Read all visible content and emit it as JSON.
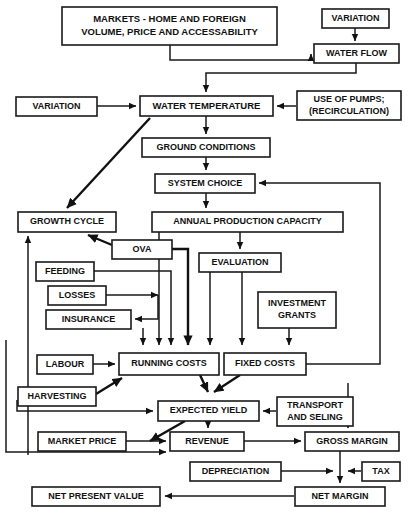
{
  "figure": {
    "type": "flowchart",
    "background": "#ffffff",
    "line_color": "#1a1a1a",
    "box_fill": "#ffffff"
  },
  "nodes": [
    {
      "id": "markets",
      "label": "MARKETS - HOME AND FOREIGN\nVOLUME, PRICE AND ACCESSABILITY",
      "x": 62,
      "y": 7,
      "w": 215,
      "h": 38,
      "fs": 9.5
    },
    {
      "id": "variation1",
      "label": "VARIATION",
      "x": 322,
      "y": 9,
      "w": 67,
      "h": 19,
      "fs": 9
    },
    {
      "id": "waterflow",
      "label": "WATER FLOW",
      "x": 314,
      "y": 44,
      "w": 85,
      "h": 19,
      "fs": 9
    },
    {
      "id": "variation2",
      "label": "VARIATION",
      "x": 16,
      "y": 97,
      "w": 81,
      "h": 19,
      "fs": 9
    },
    {
      "id": "watertemp",
      "label": "WATER TEMPERATURE",
      "x": 140,
      "y": 96,
      "w": 133,
      "h": 20,
      "fs": 9.5
    },
    {
      "id": "pumps",
      "label": "USE OF PUMPS;\n(RECIRCULATION)",
      "x": 297,
      "y": 91,
      "w": 104,
      "h": 29,
      "fs": 9
    },
    {
      "id": "ground",
      "label": "GROUND CONDITIONS",
      "x": 142,
      "y": 138,
      "w": 128,
      "h": 19,
      "fs": 9
    },
    {
      "id": "system",
      "label": "SYSTEM CHOICE",
      "x": 155,
      "y": 174,
      "w": 100,
      "h": 19,
      "fs": 9
    },
    {
      "id": "growth",
      "label": "GROWTH CYCLE",
      "x": 18,
      "y": 212,
      "w": 98,
      "h": 20,
      "fs": 9
    },
    {
      "id": "apc",
      "label": "ANNUAL PRODUCTION CAPACITY",
      "x": 152,
      "y": 212,
      "w": 191,
      "h": 20,
      "fs": 9
    },
    {
      "id": "ova",
      "label": "OVA",
      "x": 112,
      "y": 240,
      "w": 60,
      "h": 19,
      "fs": 9
    },
    {
      "id": "evaluation",
      "label": "EVALUATION",
      "x": 199,
      "y": 253,
      "w": 82,
      "h": 19,
      "fs": 9
    },
    {
      "id": "feeding",
      "label": "FEEDING",
      "x": 36,
      "y": 262,
      "w": 58,
      "h": 19,
      "fs": 9
    },
    {
      "id": "losses",
      "label": "LOSSES",
      "x": 48,
      "y": 286,
      "w": 58,
      "h": 19,
      "fs": 9
    },
    {
      "id": "investment",
      "label": "INVESTMENT\nGRANTS",
      "x": 258,
      "y": 292,
      "w": 78,
      "h": 36,
      "fs": 9
    },
    {
      "id": "insurance",
      "label": "INSURANCE",
      "x": 46,
      "y": 310,
      "w": 85,
      "h": 19,
      "fs": 9
    },
    {
      "id": "labour",
      "label": "LABOUR",
      "x": 37,
      "y": 355,
      "w": 56,
      "h": 19,
      "fs": 9
    },
    {
      "id": "running",
      "label": "RUNNING COSTS",
      "x": 119,
      "y": 353,
      "w": 100,
      "h": 22,
      "fs": 9
    },
    {
      "id": "fixed",
      "label": "FIXED COSTS",
      "x": 224,
      "y": 353,
      "w": 82,
      "h": 22,
      "fs": 9
    },
    {
      "id": "harvesting",
      "label": "HARVESTING",
      "x": 18,
      "y": 387,
      "w": 78,
      "h": 19,
      "fs": 9
    },
    {
      "id": "expected",
      "label": "EXPECTED YIELD",
      "x": 158,
      "y": 401,
      "w": 101,
      "h": 20,
      "fs": 9
    },
    {
      "id": "transport",
      "label": "TRANSPORT\nAND SELING",
      "x": 277,
      "y": 397,
      "w": 76,
      "h": 29,
      "fs": 9
    },
    {
      "id": "marketprice",
      "label": "MARKET PRICE",
      "x": 38,
      "y": 432,
      "w": 88,
      "h": 19,
      "fs": 9
    },
    {
      "id": "revenue",
      "label": "REVENUE",
      "x": 170,
      "y": 432,
      "w": 74,
      "h": 19,
      "fs": 9
    },
    {
      "id": "grossmargin",
      "label": "GROSS MARGIN",
      "x": 305,
      "y": 432,
      "w": 94,
      "h": 19,
      "fs": 9
    },
    {
      "id": "depreciation",
      "label": "DEPRECIATION",
      "x": 190,
      "y": 462,
      "w": 91,
      "h": 19,
      "fs": 9
    },
    {
      "id": "tax",
      "label": "TAX",
      "x": 362,
      "y": 462,
      "w": 38,
      "h": 19,
      "fs": 9
    },
    {
      "id": "npv",
      "label": "NET PRESENT VALUE",
      "x": 32,
      "y": 487,
      "w": 128,
      "h": 19,
      "fs": 9
    },
    {
      "id": "netmargin",
      "label": "NET MARGIN",
      "x": 295,
      "y": 487,
      "w": 90,
      "h": 19,
      "fs": 9
    }
  ],
  "edges": [
    {
      "from": "variation1",
      "to": "waterflow",
      "path": "M 355,28 L 355,41"
    },
    {
      "from": "markets",
      "to": "waterflow",
      "path": "M 170,45 L 170,60 L 311,60 L 311,54"
    },
    {
      "from": "waterflow",
      "to": "watertemp",
      "path": "M 356,63 L 356,73 L 206,73 L 206,92"
    },
    {
      "from": "variation2",
      "to": "watertemp",
      "path": "M 97,106 L 136,106"
    },
    {
      "from": "pumps",
      "to": "watertemp",
      "path": "M 296,106 L 277,106"
    },
    {
      "from": "watertemp",
      "to": "ground",
      "path": "M 206,116 L 206,134"
    },
    {
      "from": "watertemp",
      "to": "growth",
      "path": "M 150,118 L 67,208"
    },
    {
      "from": "ground",
      "to": "system",
      "path": "M 206,157 L 206,170"
    },
    {
      "from": "system",
      "to": "apc",
      "path": "M 206,193 L 206,208"
    },
    {
      "from": "apc",
      "to": "evaluation",
      "path": "M 240,232 L 240,249"
    },
    {
      "from": "ova",
      "to": "growth",
      "path": "M 112,245 L 88,235"
    },
    {
      "from": "growth",
      "to": "running",
      "path": "M 159,232 L 159,345"
    },
    {
      "from": "ova",
      "to": "running",
      "path": "M 172,249 L 188,249 L 188,345"
    },
    {
      "from": "feeding",
      "to": "running",
      "path": "M 94,271 L 171,271 L 171,345"
    },
    {
      "from": "losses",
      "to": "running",
      "path": "M 106,295 L 158,295"
    },
    {
      "from": "losses",
      "to": "insurance",
      "path": "M 158,295 L 158,319 L 135,319"
    },
    {
      "from": "insurance",
      "to": "running",
      "path": "M 143,328 L 143,345"
    },
    {
      "from": "evaluation",
      "to": "running",
      "path": "M 210,272 L 210,345"
    },
    {
      "from": "evaluation",
      "to": "fixed",
      "path": "M 242,272 L 242,345"
    },
    {
      "from": "investment",
      "to": "fixed",
      "path": "M 289,328 L 289,345"
    },
    {
      "from": "labour",
      "to": "running",
      "path": "M 93,364 L 115,364"
    },
    {
      "from": "harvesting",
      "to": "running",
      "path": "M 96,394 L 122,378"
    },
    {
      "from": "running",
      "to": "expected",
      "path": "M 200,375 L 208,392"
    },
    {
      "from": "fixed",
      "to": "expected",
      "path": "M 240,375 L 214,392"
    },
    {
      "from": "fixed",
      "to": "system",
      "path": "M 306,364 L 380,364 L 380,183 L 259,183"
    },
    {
      "from": "transport",
      "to": "expected",
      "path": "M 276,411 L 263,411"
    },
    {
      "from": "transport",
      "to": "grossmargin",
      "path": "M 348,383 L 348,428"
    },
    {
      "from": "harvesting",
      "to": "expected",
      "path": "M 17,400 L 17,411 L 153,411"
    },
    {
      "from": "expected",
      "to": "marketprice",
      "path": "M 185,421 L 150,441"
    },
    {
      "from": "expected",
      "to": "revenue",
      "path": "M 208,421 L 208,428"
    },
    {
      "from": "marketprice",
      "to": "revenue",
      "path": "M 126,441 L 166,441"
    },
    {
      "from": "growthloop",
      "to": "growth",
      "path": "M 28,455 L 28,236"
    },
    {
      "from": "loopleft",
      "to": "revenue",
      "path": "M 6,340 L 6,452 L 166,452"
    },
    {
      "from": "revenue",
      "to": "grossmargin",
      "path": "M 244,441 L 301,441"
    },
    {
      "from": "grossmargin",
      "to": "netmargin",
      "path": "M 340,451 L 340,483"
    },
    {
      "from": "depreciation",
      "to": "netmargin",
      "path": "M 281,471 L 333,471"
    },
    {
      "from": "tax",
      "to": "netmargin",
      "path": "M 361,471 L 348,471"
    },
    {
      "from": "netmargin",
      "to": "npv",
      "path": "M 294,496 L 165,496"
    }
  ],
  "caption": ""
}
